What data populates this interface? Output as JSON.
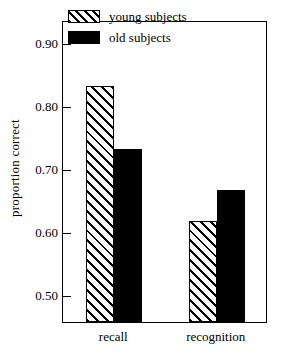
{
  "chart_data": {
    "type": "bar",
    "title": "",
    "xlabel": "",
    "ylabel": "proportion correct",
    "categories": [
      "recall",
      "recognition"
    ],
    "series": [
      {
        "name": "young subjects",
        "values": [
          0.83,
          0.615
        ],
        "fill": "hatched",
        "color": "#000000"
      },
      {
        "name": "old subjects",
        "values": [
          0.73,
          0.665
        ],
        "fill": "solid",
        "color": "#000000"
      }
    ],
    "ylim": [
      0.455,
      0.935
    ],
    "yticks": [
      0.9,
      0.8,
      0.7,
      0.6,
      0.5
    ],
    "ytick_labels": [
      "0.90",
      "0.80",
      "0.70",
      "0.60",
      "0.50"
    ],
    "grid": false,
    "legend_position": "top-right-inside",
    "frame": true,
    "background": "#ffffff"
  },
  "legend": {
    "entries": [
      {
        "label": "young subjects",
        "swatch": "hatched-swatch"
      },
      {
        "label": "old subjects",
        "swatch": "solid-black-swatch"
      }
    ]
  },
  "axes": {
    "y_title": "proportion correct",
    "y_tick_labels": [
      "0.90",
      "0.80",
      "0.70",
      "0.60",
      "0.50"
    ],
    "x_category_labels": [
      "recall",
      "recognition"
    ]
  }
}
